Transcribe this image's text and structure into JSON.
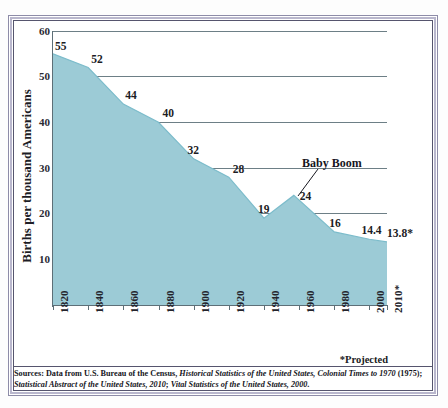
{
  "chart_data": {
    "type": "area",
    "title": "",
    "xlabel": "",
    "ylabel": "Births per thousand Americans",
    "xlim": [
      1820,
      2010
    ],
    "ylim": [
      0,
      60
    ],
    "grid": true,
    "legend": "none",
    "x_tick_labels": [
      "1820",
      "1840",
      "1860",
      "1880",
      "1900",
      "1920",
      "1940",
      "1960",
      "1980",
      "2000",
      "2010*"
    ],
    "y_tick_labels": [
      "10",
      "20",
      "30",
      "40",
      "50",
      "60"
    ],
    "y_ticks": [
      10,
      20,
      30,
      40,
      50,
      60
    ],
    "x": [
      1820,
      1840,
      1860,
      1880,
      1900,
      1920,
      1940,
      1957,
      1980,
      2000,
      2010
    ],
    "values": [
      55,
      52,
      44,
      40,
      32,
      28,
      19,
      24,
      16,
      14.4,
      13.8
    ],
    "point_labels": [
      "55",
      "52",
      "44",
      "40",
      "32",
      "28",
      "19",
      "24",
      "16",
      "14.4",
      "13.8*"
    ],
    "series": [
      {
        "name": "Births per thousand Americans",
        "values": [
          55,
          52,
          44,
          40,
          32,
          28,
          19,
          24,
          16,
          14.4,
          13.8
        ]
      }
    ],
    "annotations": [
      {
        "text": "Baby Boom",
        "points_to_x": 1957,
        "points_to_y": 24
      },
      {
        "text": "*Projected"
      }
    ],
    "colors": {
      "area_fill": "#9ccbd6",
      "area_line": "#6fb2c2",
      "gridline": "#6d7f86",
      "axis": "#5d6f77",
      "text": "#1c1c24",
      "frame_outer": "#8e8ca8",
      "frame_mid": "#b9b7cd",
      "frame_inner": "#56556e",
      "background": "#ffffff"
    }
  },
  "annotation": {
    "baby_boom": "Baby Boom",
    "projected": "*Projected"
  },
  "sources": {
    "line1_a": "Sources: Data from U.S. Bureau of the Census, ",
    "line1_b": "Historical Statistics of the United States, Colonial Times to 1970",
    "line1_c": " (1975);",
    "line2_a": "Statistical Abstract of the United States, 2010",
    "line2_b": "; ",
    "line2_c": "Vital Statistics of the United States, 2000",
    "line2_d": "."
  }
}
